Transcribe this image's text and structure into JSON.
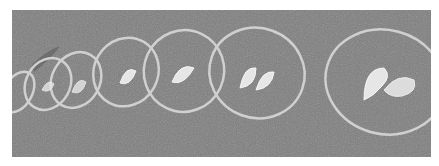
{
  "image": {
    "description": "Grayscale photo of grass with a diagonal row of hoops, each containing a pair of footprint outlines, growing larger from left to right",
    "colors": {
      "grass": "#7d7d7d",
      "grass_dark": "#6a6a6a",
      "hoop": "#d0d0d0",
      "footprint": "#e6e6e6"
    },
    "hoops": [
      {
        "cx": 6,
        "cy": 82,
        "rx": 14,
        "ry": 22
      },
      {
        "cx": 36,
        "cy": 74,
        "rx": 22,
        "ry": 27
      },
      {
        "cx": 63,
        "cy": 70,
        "rx": 24,
        "ry": 29
      },
      {
        "cx": 114,
        "cy": 62,
        "rx": 32,
        "ry": 35
      },
      {
        "cx": 171,
        "cy": 61,
        "rx": 38,
        "ry": 40
      },
      {
        "cx": 244,
        "cy": 63,
        "rx": 45,
        "ry": 48
      },
      {
        "cx": 372,
        "cy": 72,
        "rx": 56,
        "ry": 52
      }
    ]
  }
}
